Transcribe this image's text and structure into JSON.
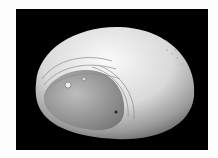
{
  "image": {
    "subject": "white perforated dome shell architectural model",
    "background_color": "#000000",
    "frame_color": "#fdfdfd"
  }
}
